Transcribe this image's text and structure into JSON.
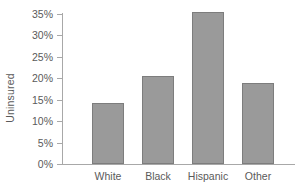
{
  "chart_data": {
    "type": "bar",
    "title": "",
    "subtitle": "",
    "xlabel": "",
    "ylabel": "Uninsured",
    "categories": [
      "White",
      "Black",
      "Hispanic",
      "Other"
    ],
    "values": [
      14.2,
      20.6,
      35.5,
      19.0
    ],
    "value_labels": [
      "14.2%",
      "20.6%",
      "35.5%",
      "19.0%"
    ],
    "ylim": [
      0,
      35
    ],
    "ytick_values": [
      0,
      5,
      10,
      15,
      20,
      25,
      30,
      35
    ],
    "ytick_labels": [
      "0%",
      "5%",
      "10%",
      "15%",
      "20%",
      "25%",
      "30%",
      "35%"
    ],
    "grid": false,
    "legend": null,
    "legend_position": "none",
    "bar_color": "#9a9a9a",
    "bar_edge_color": "#7d7d7d",
    "axis_color": "#a8a8a8",
    "text_color": "#5a5a5a",
    "background": "#ffffff",
    "annotations": []
  }
}
